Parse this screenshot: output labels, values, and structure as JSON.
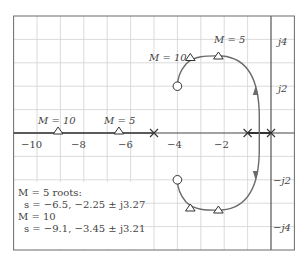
{
  "diagram": {
    "type": "root-locus",
    "axes": {
      "real_ticks": [
        {
          "value": -10,
          "label": "−10"
        },
        {
          "value": -8,
          "label": "−8"
        },
        {
          "value": -6,
          "label": "−6"
        },
        {
          "value": -4,
          "label": "−4"
        },
        {
          "value": -2,
          "label": "−2"
        }
      ],
      "imag_ticks": [
        {
          "value": 4,
          "label": "j4"
        },
        {
          "value": 2,
          "label": "j2"
        },
        {
          "value": -2,
          "label": "−j2"
        },
        {
          "value": -4,
          "label": "−j4"
        }
      ],
      "real_range": [
        -11,
        1
      ],
      "imag_range": [
        -5,
        5
      ],
      "grid": true
    },
    "poles": [
      -5,
      -1,
      0
    ],
    "zeros": [
      {
        "re": -4,
        "im": 2
      },
      {
        "re": -4,
        "im": -2
      }
    ],
    "gain_markers": [
      {
        "label": "M = 10",
        "re": -9.1,
        "im": 0
      },
      {
        "label": "M = 5",
        "re": -6.5,
        "im": 0
      },
      {
        "label": "M = 10",
        "re": -3.45,
        "im": 3.21
      },
      {
        "label": "M = 5",
        "re": -2.25,
        "im": 3.27
      },
      {
        "re": -3.45,
        "im": -3.21
      },
      {
        "re": -2.25,
        "im": -3.27
      }
    ],
    "labels": {
      "m10_real": "M = 10",
      "m5_real": "M = 5",
      "m10_upper": "M = 10",
      "m5_upper": "M = 5"
    },
    "note": {
      "line1": "M = 5 roots:",
      "line2": "s = −6.5, −2.25 ± j3.27",
      "line3": "M = 10",
      "line4": "s = −9.1, −3.45 ± j3.21"
    }
  }
}
